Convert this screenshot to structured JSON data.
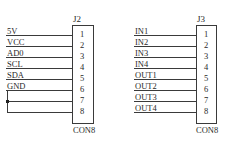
{
  "diagram": {
    "type": "schematic",
    "connectors": [
      {
        "ref": "J2",
        "part": "CON8",
        "pins": [
          "1",
          "2",
          "3",
          "4",
          "5",
          "6",
          "7",
          "8"
        ],
        "nets": [
          "5V",
          "VCC",
          "AD0",
          "SCL",
          "SDA",
          "GND",
          "",
          ""
        ],
        "notes": "Pins 7 and 8 tied together with pin 6 (GND) via junction on left"
      },
      {
        "ref": "J3",
        "part": "CON8",
        "pins": [
          "1",
          "2",
          "3",
          "4",
          "5",
          "6",
          "7",
          "8"
        ],
        "nets": [
          "IN1",
          "IN2",
          "IN3",
          "IN4",
          "OUT1",
          "OUT2",
          "OUT3",
          "OUT4"
        ]
      }
    ],
    "colors": {
      "line": "#3a3a3a",
      "text": "#2a2a2a",
      "background": "#ffffff"
    }
  }
}
